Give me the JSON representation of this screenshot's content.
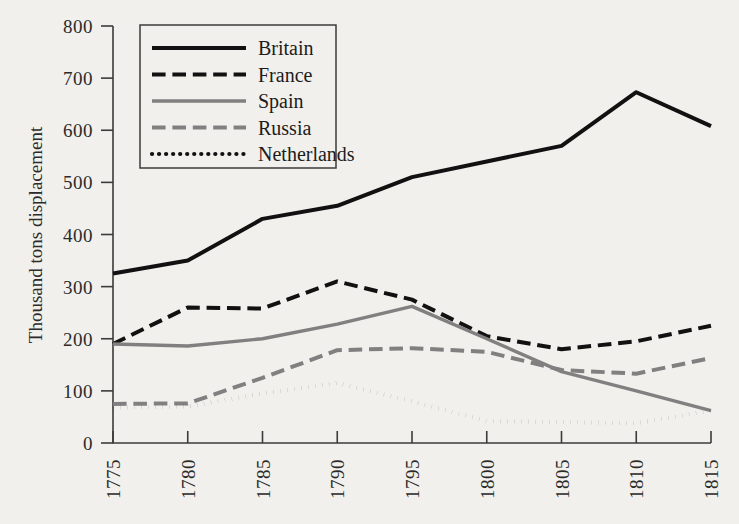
{
  "chart_data": {
    "type": "line",
    "title": "",
    "subtitle": "",
    "xlabel": "",
    "ylabel": "Thousand tons displacement",
    "x": [
      1775,
      1780,
      1785,
      1790,
      1795,
      1800,
      1805,
      1810,
      1815
    ],
    "xticklabels": [
      "1775",
      "1780",
      "1785",
      "1790",
      "1795",
      "1800",
      "1805",
      "1810",
      "1815"
    ],
    "yticks": [
      0,
      100,
      200,
      300,
      400,
      500,
      600,
      700,
      800
    ],
    "yticklabels": [
      "0",
      "100",
      "200",
      "300",
      "400",
      "500",
      "600",
      "700",
      "800"
    ],
    "xlim": [
      1775,
      1815
    ],
    "ylim": [
      0,
      800
    ],
    "grid": false,
    "legend_position": "top-left",
    "series": [
      {
        "name": "Britain",
        "color": "#111111",
        "style": "solid",
        "width": 4.0,
        "values": [
          325,
          350,
          430,
          455,
          510,
          540,
          570,
          673,
          608
        ]
      },
      {
        "name": "France",
        "color": "#111111",
        "style": "dashed",
        "width": 4.0,
        "values": [
          190,
          260,
          258,
          310,
          275,
          205,
          180,
          195,
          225
        ]
      },
      {
        "name": "Spain",
        "color": "#808080",
        "style": "solid",
        "width": 3.4,
        "values": [
          190,
          186,
          200,
          228,
          262,
          200,
          137,
          100,
          62
        ]
      },
      {
        "name": "Russia",
        "color": "#808080",
        "style": "dashed",
        "width": 4.0,
        "values": [
          75,
          76,
          125,
          178,
          182,
          175,
          140,
          133,
          163
        ]
      },
      {
        "name": "Netherlands",
        "color": "#111111",
        "style": "dotted",
        "width": 4.2,
        "values": [
          68,
          70,
          95,
          115,
          80,
          42,
          40,
          38,
          62
        ]
      }
    ]
  },
  "axes": {
    "y_axis_title": "Thousand tons displacement"
  },
  "legend": {
    "entries": [
      {
        "label": "Britain"
      },
      {
        "label": "France"
      },
      {
        "label": "Spain"
      },
      {
        "label": "Russia"
      },
      {
        "label": "Netherlands"
      }
    ]
  },
  "colors": {
    "background": "#f2f0ec",
    "axis": "#3b3b3b",
    "black_series": "#111111",
    "gray_series": "#808080"
  }
}
